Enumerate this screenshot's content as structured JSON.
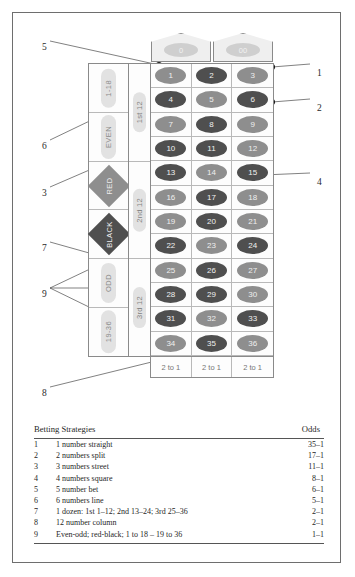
{
  "diagram": {
    "zero_cells": [
      {
        "label": "0",
        "name": "zero"
      },
      {
        "label": "00",
        "name": "double-zero"
      }
    ],
    "numbers": [
      {
        "n": "1",
        "color": "red"
      },
      {
        "n": "2",
        "color": "black"
      },
      {
        "n": "3",
        "color": "red"
      },
      {
        "n": "4",
        "color": "black"
      },
      {
        "n": "5",
        "color": "red"
      },
      {
        "n": "6",
        "color": "black"
      },
      {
        "n": "7",
        "color": "red"
      },
      {
        "n": "8",
        "color": "black"
      },
      {
        "n": "9",
        "color": "red"
      },
      {
        "n": "10",
        "color": "black"
      },
      {
        "n": "11",
        "color": "black"
      },
      {
        "n": "12",
        "color": "red"
      },
      {
        "n": "13",
        "color": "black"
      },
      {
        "n": "14",
        "color": "red"
      },
      {
        "n": "15",
        "color": "black"
      },
      {
        "n": "16",
        "color": "red"
      },
      {
        "n": "17",
        "color": "black"
      },
      {
        "n": "18",
        "color": "red"
      },
      {
        "n": "19",
        "color": "red"
      },
      {
        "n": "20",
        "color": "black"
      },
      {
        "n": "21",
        "color": "red"
      },
      {
        "n": "22",
        "color": "black"
      },
      {
        "n": "23",
        "color": "red"
      },
      {
        "n": "24",
        "color": "black"
      },
      {
        "n": "25",
        "color": "red"
      },
      {
        "n": "26",
        "color": "black"
      },
      {
        "n": "27",
        "color": "red"
      },
      {
        "n": "28",
        "color": "black"
      },
      {
        "n": "29",
        "color": "black"
      },
      {
        "n": "30",
        "color": "red"
      },
      {
        "n": "31",
        "color": "black"
      },
      {
        "n": "32",
        "color": "red"
      },
      {
        "n": "33",
        "color": "black"
      },
      {
        "n": "34",
        "color": "red"
      },
      {
        "n": "35",
        "color": "black"
      },
      {
        "n": "36",
        "color": "red"
      }
    ],
    "column_bets": [
      "2 to 1",
      "2 to 1",
      "2 to 1"
    ],
    "dozens": [
      "1st 12",
      "2nd 12",
      "3rd 12"
    ],
    "outside_bets": [
      {
        "label": "1-18",
        "shape": "pill"
      },
      {
        "label": "EVEN",
        "shape": "pill"
      },
      {
        "label": "RED",
        "shape": "diamond",
        "color": "red"
      },
      {
        "label": "BLACK",
        "shape": "diamond",
        "color": "black"
      },
      {
        "label": "ODD",
        "shape": "pill"
      },
      {
        "label": "19-36",
        "shape": "pill"
      }
    ],
    "callouts": [
      {
        "id": "1",
        "x": 317,
        "y": 68
      },
      {
        "id": "2",
        "x": 317,
        "y": 103
      },
      {
        "id": "3",
        "x": 42,
        "y": 188
      },
      {
        "id": "4",
        "x": 317,
        "y": 177
      },
      {
        "id": "5",
        "x": 42,
        "y": 42
      },
      {
        "id": "6",
        "x": 42,
        "y": 141
      },
      {
        "id": "7",
        "x": 42,
        "y": 243
      },
      {
        "id": "8",
        "x": 42,
        "y": 388
      },
      {
        "id": "9",
        "x": 42,
        "y": 289
      }
    ]
  },
  "strategies_table": {
    "header": {
      "title": "Betting Strategies",
      "odds": "Odds"
    },
    "rows": [
      {
        "idx": "1",
        "desc": "1 number straight",
        "odds": "35–1"
      },
      {
        "idx": "2",
        "desc": "2 numbers split",
        "odds": "17–1"
      },
      {
        "idx": "3",
        "desc": "3 numbers street",
        "odds": "11–1"
      },
      {
        "idx": "4",
        "desc": "4 numbers square",
        "odds": "8–1"
      },
      {
        "idx": "5",
        "desc": "5 number bet",
        "odds": "6–1"
      },
      {
        "idx": "6",
        "desc": "6 numbers line",
        "odds": "5–1"
      },
      {
        "idx": "7",
        "desc": "1 dozen:  1st 1–12; 2nd 13–24; 3rd 25–36",
        "odds": "2–1"
      },
      {
        "idx": "8",
        "desc": "12 number column",
        "odds": "2–1"
      },
      {
        "idx": "9",
        "desc": "Even-odd; red-black; 1 to 18 – 19 to 36",
        "odds": "1–1"
      }
    ]
  }
}
